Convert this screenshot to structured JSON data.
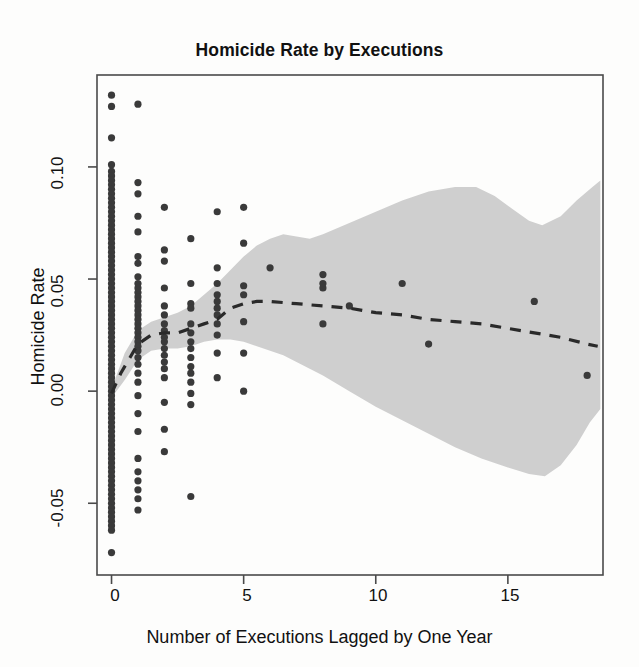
{
  "chart_data": {
    "type": "scatter",
    "title": "Homicide Rate by Executions",
    "xlabel": "Number of Executions Lagged by One Year",
    "ylabel": "Homicide Rate",
    "xlim": [
      -0.55,
      18.6
    ],
    "ylim": [
      -0.082,
      0.141
    ],
    "xticks": [
      0,
      5,
      10,
      15
    ],
    "xtick_labels": [
      "0",
      "5",
      "10",
      "15"
    ],
    "yticks": [
      -0.05,
      0.0,
      0.05,
      0.1
    ],
    "ytick_labels": [
      "-0.05",
      "0.00",
      "0.05",
      "0.10"
    ],
    "grid": false,
    "legend": null,
    "colors": {
      "point": "#3a3a3a",
      "band": "#cfcfcf",
      "line": "#2a2a2a",
      "frame": "#4a4a4a",
      "background": "#fdfdfc"
    },
    "series": [
      {
        "name": "Observations",
        "type": "scatter",
        "marker": "filled-circle",
        "points": [
          [
            0,
            0.132
          ],
          [
            0,
            0.127
          ],
          [
            0,
            0.113
          ],
          [
            0,
            0.101
          ],
          [
            0,
            0.098
          ],
          [
            0,
            0.096
          ],
          [
            0,
            0.094
          ],
          [
            0,
            0.092
          ],
          [
            0,
            0.09
          ],
          [
            0,
            0.088
          ],
          [
            0,
            0.086
          ],
          [
            0,
            0.084
          ],
          [
            0,
            0.082
          ],
          [
            0,
            0.08
          ],
          [
            0,
            0.078
          ],
          [
            0,
            0.076
          ],
          [
            0,
            0.074
          ],
          [
            0,
            0.072
          ],
          [
            0,
            0.07
          ],
          [
            0,
            0.068
          ],
          [
            0,
            0.066
          ],
          [
            0,
            0.064
          ],
          [
            0,
            0.062
          ],
          [
            0,
            0.06
          ],
          [
            0,
            0.058
          ],
          [
            0,
            0.056
          ],
          [
            0,
            0.054
          ],
          [
            0,
            0.052
          ],
          [
            0,
            0.05
          ],
          [
            0,
            0.048
          ],
          [
            0,
            0.046
          ],
          [
            0,
            0.044
          ],
          [
            0,
            0.042
          ],
          [
            0,
            0.04
          ],
          [
            0,
            0.038
          ],
          [
            0,
            0.036
          ],
          [
            0,
            0.034
          ],
          [
            0,
            0.032
          ],
          [
            0,
            0.03
          ],
          [
            0,
            0.028
          ],
          [
            0,
            0.026
          ],
          [
            0,
            0.024
          ],
          [
            0,
            0.022
          ],
          [
            0,
            0.02
          ],
          [
            0,
            0.018
          ],
          [
            0,
            0.016
          ],
          [
            0,
            0.014
          ],
          [
            0,
            0.012
          ],
          [
            0,
            0.01
          ],
          [
            0,
            0.008
          ],
          [
            0,
            0.006
          ],
          [
            0,
            0.004
          ],
          [
            0,
            0.002
          ],
          [
            0,
            0.0
          ],
          [
            0,
            -0.002
          ],
          [
            0,
            -0.004
          ],
          [
            0,
            -0.006
          ],
          [
            0,
            -0.008
          ],
          [
            0,
            -0.01
          ],
          [
            0,
            -0.012
          ],
          [
            0,
            -0.014
          ],
          [
            0,
            -0.016
          ],
          [
            0,
            -0.018
          ],
          [
            0,
            -0.02
          ],
          [
            0,
            -0.022
          ],
          [
            0,
            -0.024
          ],
          [
            0,
            -0.026
          ],
          [
            0,
            -0.028
          ],
          [
            0,
            -0.03
          ],
          [
            0,
            -0.032
          ],
          [
            0,
            -0.034
          ],
          [
            0,
            -0.036
          ],
          [
            0,
            -0.038
          ],
          [
            0,
            -0.04
          ],
          [
            0,
            -0.042
          ],
          [
            0,
            -0.044
          ],
          [
            0,
            -0.046
          ],
          [
            0,
            -0.048
          ],
          [
            0,
            -0.05
          ],
          [
            0,
            -0.052
          ],
          [
            0,
            -0.054
          ],
          [
            0,
            -0.056
          ],
          [
            0,
            -0.058
          ],
          [
            0,
            -0.06
          ],
          [
            0,
            -0.062
          ],
          [
            0,
            -0.072
          ],
          [
            1,
            0.128
          ],
          [
            1,
            0.093
          ],
          [
            1,
            0.088
          ],
          [
            1,
            0.078
          ],
          [
            1,
            0.071
          ],
          [
            1,
            0.06
          ],
          [
            1,
            0.057
          ],
          [
            1,
            0.051
          ],
          [
            1,
            0.048
          ],
          [
            1,
            0.046
          ],
          [
            1,
            0.044
          ],
          [
            1,
            0.042
          ],
          [
            1,
            0.04
          ],
          [
            1,
            0.038
          ],
          [
            1,
            0.036
          ],
          [
            1,
            0.034
          ],
          [
            1,
            0.032
          ],
          [
            1,
            0.03
          ],
          [
            1,
            0.028
          ],
          [
            1,
            0.026
          ],
          [
            1,
            0.024
          ],
          [
            1,
            0.022
          ],
          [
            1,
            0.02
          ],
          [
            1,
            0.018
          ],
          [
            1,
            0.015
          ],
          [
            1,
            0.012
          ],
          [
            1,
            0.008
          ],
          [
            1,
            0.004
          ],
          [
            1,
            -0.002
          ],
          [
            1,
            -0.01
          ],
          [
            1,
            -0.018
          ],
          [
            1,
            -0.03
          ],
          [
            1,
            -0.036
          ],
          [
            1,
            -0.04
          ],
          [
            1,
            -0.044
          ],
          [
            1,
            -0.048
          ],
          [
            1,
            -0.053
          ],
          [
            2,
            0.082
          ],
          [
            2,
            0.063
          ],
          [
            2,
            0.058
          ],
          [
            2,
            0.046
          ],
          [
            2,
            0.038
          ],
          [
            2,
            0.034
          ],
          [
            2,
            0.03
          ],
          [
            2,
            0.027
          ],
          [
            2,
            0.024
          ],
          [
            2,
            0.022
          ],
          [
            2,
            0.019
          ],
          [
            2,
            0.016
          ],
          [
            2,
            0.013
          ],
          [
            2,
            0.01
          ],
          [
            2,
            0.006
          ],
          [
            2,
            -0.005
          ],
          [
            2,
            -0.017
          ],
          [
            2,
            -0.027
          ],
          [
            3,
            0.068
          ],
          [
            3,
            0.048
          ],
          [
            3,
            0.039
          ],
          [
            3,
            0.037
          ],
          [
            3,
            0.03
          ],
          [
            3,
            0.026
          ],
          [
            3,
            0.022
          ],
          [
            3,
            0.019
          ],
          [
            3,
            0.015
          ],
          [
            3,
            0.011
          ],
          [
            3,
            0.008
          ],
          [
            3,
            0.004
          ],
          [
            3,
            -0.001
          ],
          [
            3,
            -0.006
          ],
          [
            3,
            -0.047
          ],
          [
            4,
            0.08
          ],
          [
            4,
            0.055
          ],
          [
            4,
            0.048
          ],
          [
            4,
            0.043
          ],
          [
            4,
            0.04
          ],
          [
            4,
            0.037
          ],
          [
            4,
            0.034
          ],
          [
            4,
            0.03
          ],
          [
            4,
            0.025
          ],
          [
            4,
            0.017
          ],
          [
            4,
            0.006
          ],
          [
            5,
            0.082
          ],
          [
            5,
            0.066
          ],
          [
            5,
            0.047
          ],
          [
            5,
            0.043
          ],
          [
            5,
            0.031
          ],
          [
            5,
            0.017
          ],
          [
            5,
            0.0
          ],
          [
            6,
            0.055
          ],
          [
            8,
            0.052
          ],
          [
            8,
            0.048
          ],
          [
            8,
            0.046
          ],
          [
            8,
            0.03
          ],
          [
            9,
            0.038
          ],
          [
            11,
            0.048
          ],
          [
            12,
            0.021
          ],
          [
            16,
            0.04
          ],
          [
            18,
            0.007
          ]
        ]
      },
      {
        "name": "Smoothed fit",
        "type": "line",
        "style": "dashed",
        "points": [
          [
            0.0,
            -0.001
          ],
          [
            0.35,
            0.008
          ],
          [
            0.7,
            0.015
          ],
          [
            1.0,
            0.021
          ],
          [
            1.5,
            0.025
          ],
          [
            2.0,
            0.026
          ],
          [
            2.5,
            0.026
          ],
          [
            3.0,
            0.028
          ],
          [
            3.5,
            0.03
          ],
          [
            4.0,
            0.032
          ],
          [
            4.5,
            0.037
          ],
          [
            5.0,
            0.039
          ],
          [
            5.5,
            0.04
          ],
          [
            6.0,
            0.04
          ],
          [
            7.0,
            0.039
          ],
          [
            8.0,
            0.038
          ],
          [
            9.0,
            0.037
          ],
          [
            10.0,
            0.035
          ],
          [
            11.0,
            0.034
          ],
          [
            12.0,
            0.032
          ],
          [
            13.0,
            0.031
          ],
          [
            14.0,
            0.03
          ],
          [
            15.0,
            0.028
          ],
          [
            16.0,
            0.026
          ],
          [
            17.0,
            0.024
          ],
          [
            18.0,
            0.021
          ],
          [
            18.4,
            0.02
          ]
        ]
      },
      {
        "name": "Confidence band",
        "type": "band",
        "upper": [
          [
            0.0,
            0.001
          ],
          [
            0.5,
            0.017
          ],
          [
            1.0,
            0.027
          ],
          [
            1.5,
            0.031
          ],
          [
            2.0,
            0.033
          ],
          [
            2.5,
            0.035
          ],
          [
            3.0,
            0.038
          ],
          [
            3.5,
            0.043
          ],
          [
            4.0,
            0.048
          ],
          [
            4.5,
            0.054
          ],
          [
            5.0,
            0.06
          ],
          [
            5.5,
            0.065
          ],
          [
            6.0,
            0.068
          ],
          [
            6.5,
            0.07
          ],
          [
            7.0,
            0.069
          ],
          [
            7.5,
            0.068
          ],
          [
            8.0,
            0.07
          ],
          [
            9.0,
            0.075
          ],
          [
            10.0,
            0.08
          ],
          [
            11.0,
            0.085
          ],
          [
            12.0,
            0.089
          ],
          [
            13.0,
            0.091
          ],
          [
            13.8,
            0.091
          ],
          [
            14.5,
            0.087
          ],
          [
            15.2,
            0.081
          ],
          [
            15.8,
            0.076
          ],
          [
            16.3,
            0.074
          ],
          [
            17.0,
            0.078
          ],
          [
            17.6,
            0.085
          ],
          [
            18.2,
            0.091
          ],
          [
            18.5,
            0.094
          ]
        ],
        "lower": [
          [
            0.0,
            -0.003
          ],
          [
            0.5,
            0.005
          ],
          [
            1.0,
            0.014
          ],
          [
            1.5,
            0.018
          ],
          [
            2.0,
            0.019
          ],
          [
            2.5,
            0.019
          ],
          [
            3.0,
            0.02
          ],
          [
            3.5,
            0.022
          ],
          [
            4.0,
            0.023
          ],
          [
            4.5,
            0.023
          ],
          [
            5.0,
            0.022
          ],
          [
            5.5,
            0.02
          ],
          [
            6.0,
            0.018
          ],
          [
            6.5,
            0.016
          ],
          [
            7.0,
            0.013
          ],
          [
            7.5,
            0.01
          ],
          [
            8.0,
            0.007
          ],
          [
            9.0,
            0.0
          ],
          [
            10.0,
            -0.007
          ],
          [
            11.0,
            -0.013
          ],
          [
            12.0,
            -0.019
          ],
          [
            13.0,
            -0.025
          ],
          [
            14.0,
            -0.03
          ],
          [
            15.0,
            -0.034
          ],
          [
            15.8,
            -0.037
          ],
          [
            16.4,
            -0.038
          ],
          [
            17.0,
            -0.033
          ],
          [
            17.6,
            -0.024
          ],
          [
            18.1,
            -0.014
          ],
          [
            18.5,
            -0.008
          ]
        ]
      }
    ]
  }
}
